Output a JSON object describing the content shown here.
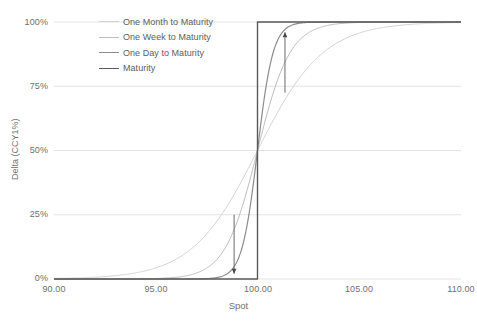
{
  "chart_data": {
    "type": "line",
    "title": "",
    "xlabel": "Spot",
    "ylabel": "Delta (CCY1%)",
    "xlim": [
      90.0,
      110.0
    ],
    "ylim": [
      0,
      100
    ],
    "xticks": [
      "90.00",
      "95.00",
      "100.00",
      "105.00",
      "110.00"
    ],
    "xtick_values": [
      90.0,
      95.0,
      100.0,
      105.0,
      110.0
    ],
    "yticks": [
      "0%",
      "25%",
      "50%",
      "75%",
      "100%"
    ],
    "ytick_values": [
      0,
      25,
      50,
      75,
      100
    ],
    "grid": true,
    "legend_position": "top-left-inside",
    "strike": 100.0,
    "series": [
      {
        "name": "One Month to Maturity",
        "color": "#d3d3d3",
        "width": 1.0,
        "shape": "sigmoid",
        "steepness": 0.62,
        "x": [
          90.0,
          91.0,
          92.0,
          93.0,
          94.0,
          95.0,
          96.0,
          97.0,
          98.0,
          99.0,
          100.0,
          101.0,
          102.0,
          103.0,
          104.0,
          105.0,
          106.0,
          107.0,
          108.0,
          109.0,
          110.0
        ],
        "values": [
          0.2,
          0.4,
          0.8,
          1.6,
          3.1,
          5.9,
          10.7,
          18.4,
          29.4,
          41.2,
          50.0,
          61.6,
          72.1,
          80.8,
          87.4,
          92.0,
          95.1,
          97.1,
          98.3,
          99.0,
          99.5
        ]
      },
      {
        "name": "One Week to Maturity",
        "color": "#bdbdbd",
        "width": 1.0,
        "shape": "sigmoid",
        "steepness": 1.25,
        "x": [
          90.0,
          91.0,
          92.0,
          93.0,
          94.0,
          95.0,
          96.0,
          97.0,
          98.0,
          99.0,
          100.0,
          101.0,
          102.0,
          103.0,
          104.0,
          105.0,
          106.0,
          107.0,
          108.0,
          109.0,
          110.0
        ],
        "values": [
          0.0,
          0.0,
          0.1,
          0.2,
          0.5,
          1.4,
          3.8,
          9.6,
          22.0,
          39.5,
          50.0,
          70.8,
          85.8,
          93.5,
          97.2,
          98.8,
          99.5,
          99.8,
          99.9,
          100.0,
          100.0
        ]
      },
      {
        "name": "One Day to Maturity",
        "color": "#8c8c8c",
        "width": 1.2,
        "shape": "sigmoid",
        "steepness": 2.6,
        "x": [
          90.0,
          91.0,
          92.0,
          93.0,
          94.0,
          95.0,
          96.0,
          97.0,
          98.0,
          99.0,
          100.0,
          101.0,
          102.0,
          103.0,
          104.0,
          105.0,
          106.0,
          107.0,
          108.0,
          109.0,
          110.0
        ],
        "values": [
          0.0,
          0.0,
          0.0,
          0.0,
          0.0,
          0.1,
          0.3,
          1.4,
          7.2,
          28.5,
          50.0,
          86.5,
          97.4,
          99.5,
          99.9,
          100.0,
          100.0,
          100.0,
          100.0,
          100.0,
          100.0
        ]
      },
      {
        "name": "Maturity",
        "color": "#595959",
        "width": 1.4,
        "shape": "step",
        "x": [
          90.0,
          100.0,
          100.0,
          110.0
        ],
        "values": [
          0,
          0,
          100,
          100
        ]
      }
    ],
    "annotations": [
      {
        "name": "left-down-arrow",
        "direction": "down",
        "x": 98.85,
        "y_start": 25.0,
        "y_end": 2.0
      },
      {
        "name": "right-up-arrow",
        "direction": "up",
        "x": 101.35,
        "y_start": 72.5,
        "y_end": 96.0
      }
    ]
  },
  "legend": {
    "items": [
      {
        "label": "One Month to Maturity",
        "color": "#d3d3d3",
        "thickness": "1px"
      },
      {
        "label": "One Week to Maturity",
        "color": "#bdbdbd",
        "thickness": "1px"
      },
      {
        "label": "One Day to Maturity",
        "color": "#8c8c8c",
        "thickness": "1.2px"
      },
      {
        "label": "Maturity",
        "color": "#595959",
        "thickness": "1.6px"
      }
    ]
  },
  "axes": {
    "x_title": "Spot",
    "y_title": "Delta (CCY1%)",
    "x_tick_labels": [
      "90.00",
      "95.00",
      "100.00",
      "105.00",
      "110.00"
    ],
    "y_tick_labels": [
      "100%",
      "75%",
      "50%",
      "25%",
      "0%"
    ]
  },
  "colors": {
    "grid": "#dcdcdc",
    "axis_text": "#6f6f6f",
    "background": "#ffffff"
  }
}
